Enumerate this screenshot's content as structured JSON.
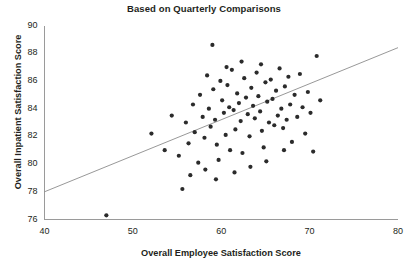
{
  "chart_data": {
    "type": "scatter",
    "title": "Based on Quarterly Comparisons",
    "xlabel": "Overall Employee Satisfaction Score",
    "ylabel": "Overall Inpatient Satisfaction Score",
    "xlim": [
      40,
      80
    ],
    "ylim": [
      76,
      90
    ],
    "xticks": [
      40,
      50,
      60,
      70,
      80
    ],
    "yticks": [
      76,
      78,
      80,
      82,
      84,
      86,
      88,
      90
    ],
    "xtick_labels": [
      "40",
      "50",
      "60",
      "70",
      "80"
    ],
    "ytick_labels": [
      "76",
      "78",
      "80",
      "82",
      "84",
      "86",
      "88",
      "90"
    ],
    "grid": false,
    "legend": null,
    "marker_color": "#2b2b2b",
    "marker_size": 2.1,
    "axis_color": "#9a9a9a",
    "trendline": {
      "color": "#8c8c8c",
      "x": [
        40,
        80
      ],
      "y": [
        78.0,
        88.4
      ]
    },
    "points": [
      [
        47.0,
        76.3
      ],
      [
        52.1,
        82.2
      ],
      [
        53.6,
        81.0
      ],
      [
        54.4,
        83.5
      ],
      [
        55.2,
        80.6
      ],
      [
        55.6,
        78.2
      ],
      [
        56.0,
        83.0
      ],
      [
        56.3,
        81.5
      ],
      [
        56.8,
        84.3
      ],
      [
        57.0,
        82.3
      ],
      [
        57.4,
        80.1
      ],
      [
        57.6,
        85.0
      ],
      [
        57.9,
        83.4
      ],
      [
        58.1,
        81.9
      ],
      [
        58.4,
        86.4
      ],
      [
        58.6,
        84.0
      ],
      [
        58.8,
        82.7
      ],
      [
        59.0,
        88.6
      ],
      [
        59.1,
        85.4
      ],
      [
        59.3,
        83.2
      ],
      [
        59.5,
        81.4
      ],
      [
        59.7,
        80.3
      ],
      [
        59.9,
        86.0
      ],
      [
        60.1,
        84.6
      ],
      [
        60.3,
        83.7
      ],
      [
        60.5,
        82.1
      ],
      [
        60.7,
        85.7
      ],
      [
        60.9,
        84.1
      ],
      [
        61.0,
        81.0
      ],
      [
        61.2,
        86.8
      ],
      [
        61.4,
        83.9
      ],
      [
        61.6,
        82.5
      ],
      [
        61.8,
        85.1
      ],
      [
        62.0,
        84.4
      ],
      [
        62.2,
        83.1
      ],
      [
        62.4,
        80.8
      ],
      [
        62.6,
        86.2
      ],
      [
        62.8,
        84.8
      ],
      [
        63.0,
        83.6
      ],
      [
        63.2,
        82.0
      ],
      [
        63.4,
        85.5
      ],
      [
        63.6,
        84.2
      ],
      [
        63.8,
        83.3
      ],
      [
        64.0,
        86.6
      ],
      [
        64.2,
        84.9
      ],
      [
        64.4,
        83.8
      ],
      [
        64.6,
        82.4
      ],
      [
        64.8,
        81.2
      ],
      [
        65.0,
        85.9
      ],
      [
        65.2,
        84.5
      ],
      [
        65.4,
        83.0
      ],
      [
        65.6,
        86.1
      ],
      [
        65.8,
        84.7
      ],
      [
        66.0,
        82.8
      ],
      [
        66.2,
        85.3
      ],
      [
        66.4,
        83.5
      ],
      [
        66.6,
        86.9
      ],
      [
        66.8,
        84.0
      ],
      [
        67.0,
        82.6
      ],
      [
        67.2,
        85.6
      ],
      [
        67.4,
        83.2
      ],
      [
        67.6,
        86.3
      ],
      [
        67.8,
        84.3
      ],
      [
        68.0,
        81.6
      ],
      [
        68.3,
        85.0
      ],
      [
        68.6,
        83.4
      ],
      [
        68.9,
        86.5
      ],
      [
        69.2,
        84.1
      ],
      [
        69.5,
        82.2
      ],
      [
        69.8,
        85.2
      ],
      [
        70.1,
        83.7
      ],
      [
        70.4,
        80.9
      ],
      [
        70.8,
        87.8
      ],
      [
        71.2,
        84.6
      ],
      [
        62.3,
        87.4
      ],
      [
        64.5,
        87.2
      ],
      [
        60.6,
        87.0
      ],
      [
        58.2,
        79.6
      ],
      [
        56.5,
        79.2
      ],
      [
        61.5,
        79.4
      ],
      [
        63.3,
        79.8
      ],
      [
        65.1,
        80.2
      ],
      [
        59.4,
        78.9
      ],
      [
        67.1,
        81.0
      ]
    ]
  }
}
